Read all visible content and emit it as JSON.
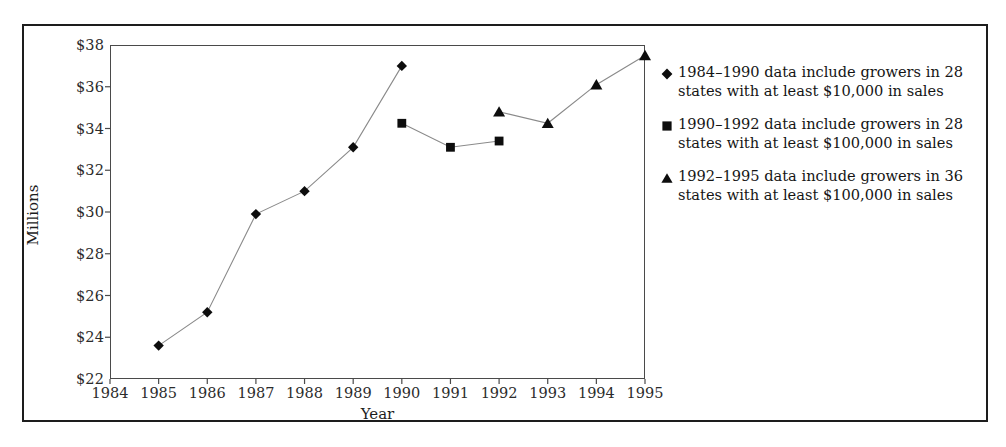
{
  "chart_data": {
    "type": "line",
    "title": "",
    "xlabel": "Year",
    "ylabel": "Millions",
    "xlim": [
      1984,
      1995
    ],
    "ylim": [
      22,
      38
    ],
    "ytick_step": 2,
    "grid": false,
    "legend_position": "right",
    "x_tick_labels": [
      "1984",
      "1985",
      "1986",
      "1987",
      "1988",
      "1989",
      "1990",
      "1991",
      "1992",
      "1993",
      "1994",
      "1995"
    ],
    "y_tick_labels": [
      "$22",
      "$24",
      "$26",
      "$28",
      "$30",
      "$32",
      "$34",
      "$36",
      "$38"
    ],
    "y_tick_values": [
      22,
      24,
      26,
      28,
      30,
      32,
      34,
      36,
      38
    ],
    "series": [
      {
        "name": "1984–1990 data include growers in 28 states with at least $10,000 in sales",
        "marker": "diamond",
        "x": [
          1985,
          1986,
          1987,
          1988,
          1989,
          1990
        ],
        "values": [
          23.6,
          25.2,
          29.9,
          31.0,
          33.1,
          37.0
        ]
      },
      {
        "name": "1990–1992 data include growers in 28 states with at least $100,000 in sales",
        "marker": "square",
        "x": [
          1990,
          1991,
          1992
        ],
        "values": [
          34.25,
          33.1,
          33.4
        ]
      },
      {
        "name": "1992–1995 data include growers in 36 states with at least $100,000 in sales",
        "marker": "triangle",
        "x": [
          1992,
          1993,
          1994,
          1995
        ],
        "values": [
          34.8,
          34.25,
          36.1,
          37.5
        ]
      }
    ]
  },
  "axes": {
    "x_title": "Year",
    "y_title": "Millions"
  },
  "legend": {
    "items": [
      {
        "marker": "diamond-marker-icon",
        "line1": "1984–1990 data include growers in 28",
        "line2": "states with at least $10,000 in sales",
        "text": "1984–1990 data include growers in 28 states with at least $10,000 in sales"
      },
      {
        "marker": "square-marker-icon",
        "line1": "1990–1992 data include growers in 28",
        "line2": "states with at least $100,000 in sales",
        "text": "1990–1992 data include growers in 28 states with at least $100,000 in sales"
      },
      {
        "marker": "triangle-marker-icon",
        "line1": "1992–1995 data include growers in 36",
        "line2": "states with at least $100,000 in sales",
        "text": "1992–1995 data include growers in 36 states with at least $100,000 in sales"
      }
    ]
  },
  "colors": {
    "frame": "#1d1d1d",
    "axis": "#4a4a4a",
    "line": "#8a8a8a",
    "marker": "#0d0d0d",
    "text": "#1d1d1d",
    "background": "#ffffff"
  }
}
